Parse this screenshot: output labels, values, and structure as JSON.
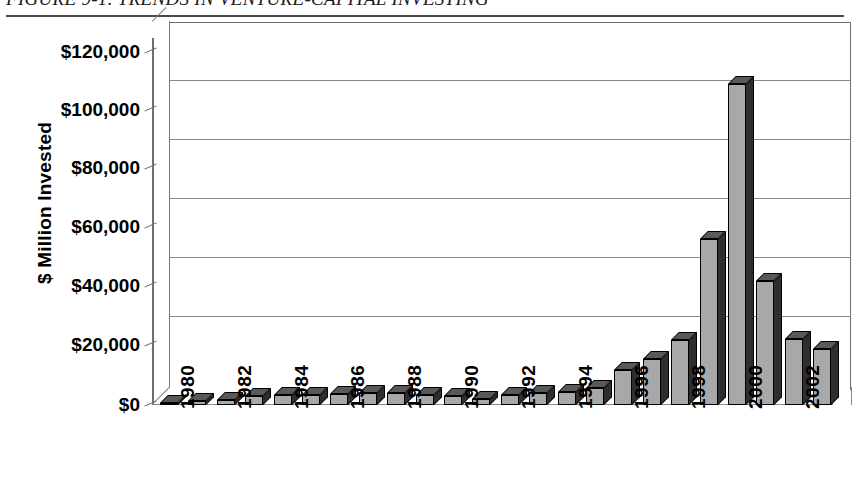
{
  "figure": {
    "caption": "FIGURE 9-1. TRENDS IN VENTURE-CAPITAL INVESTING"
  },
  "chart_data": {
    "type": "bar",
    "title": "FIGURE 9-1. TRENDS IN VENTURE-CAPITAL INVESTING",
    "xlabel": "",
    "ylabel": "$ Million Invested",
    "ylim": [
      0,
      120000
    ],
    "ytick_labels": [
      "$0",
      "$20,000",
      "$40,000",
      "$60,000",
      "$80,000",
      "$100,000",
      "$120,000"
    ],
    "ytick_values": [
      0,
      20000,
      40000,
      60000,
      80000,
      100000,
      120000
    ],
    "xtick_labels": [
      "1980",
      "1982",
      "1984",
      "1986",
      "1988",
      "1990",
      "1992",
      "1994",
      "1996",
      "1998",
      "2000",
      "2002"
    ],
    "grid": true,
    "legend": "none",
    "style": "3d-column-grayscale",
    "categories": [
      "1980",
      "1981",
      "1982",
      "1983",
      "1984",
      "1985",
      "1986",
      "1987",
      "1988",
      "1989",
      "1990",
      "1991",
      "1992",
      "1993",
      "1994",
      "1995",
      "1996",
      "1997",
      "1998",
      "1999",
      "2000",
      "2001",
      "2002",
      "2003"
    ],
    "values": [
      700,
      1200,
      1700,
      2800,
      3200,
      3300,
      3700,
      4000,
      3900,
      3400,
      2800,
      2100,
      3400,
      3800,
      4200,
      5600,
      11500,
      14900,
      21200,
      54200,
      105000,
      40500,
      21500,
      18200
    ]
  }
}
